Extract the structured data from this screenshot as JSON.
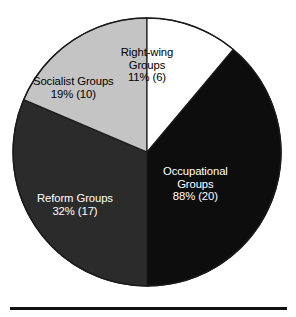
{
  "chart_data": {
    "type": "pie",
    "title": "",
    "subtitle": "",
    "xlabel": "",
    "ylabel": "",
    "legend_position": "none",
    "grid": false,
    "note": "Percentages sum to 150% because respondents could belong to more than one group type (multiple response).",
    "total_percent": 150,
    "start_angle_deg": 0,
    "direction": "clockwise",
    "categories": [
      "Right-wing Groups",
      "Occupational Groups",
      "Reform Groups",
      "Socialist Groups"
    ],
    "values": [
      11,
      88,
      32,
      19
    ],
    "counts": [
      6,
      20,
      17,
      10
    ],
    "slices": [
      {
        "label": "Right-wing Groups",
        "label_line1": "Right-wing",
        "label_line2": "Groups",
        "value_text": "11% (6)",
        "percent": 11,
        "count": 6,
        "color": "#ffffff",
        "text_color": "#000000",
        "sweep_deg": 40,
        "start_deg": 0
      },
      {
        "label": "Occupational Groups",
        "label_line1": "Occupational",
        "label_line2": "Groups",
        "value_text": "88% (20)",
        "percent": 88,
        "count": 20,
        "color": "#0d0d0d",
        "text_color": "#ffffff",
        "sweep_deg": 140,
        "start_deg": 40
      },
      {
        "label": "Reform Groups",
        "label_line1": "Reform Groups",
        "label_line2": "",
        "value_text": "32% (17)",
        "percent": 32,
        "count": 17,
        "color": "#2b2b2b",
        "text_color": "#ffffff",
        "sweep_deg": 113,
        "start_deg": 180
      },
      {
        "label": "Socialist Groups",
        "label_line1": "Socialist Groups",
        "label_line2": "",
        "value_text": "19% (10)",
        "percent": 19,
        "count": 10,
        "color": "#c4c4c4",
        "text_color": "#000000",
        "sweep_deg": 67,
        "start_deg": 293
      }
    ],
    "geometry": {
      "center_x": 147,
      "center_y": 152,
      "radius": 134,
      "outline_color": "#1a1a1a"
    },
    "rule": {
      "present": true,
      "color": "#111111"
    }
  }
}
